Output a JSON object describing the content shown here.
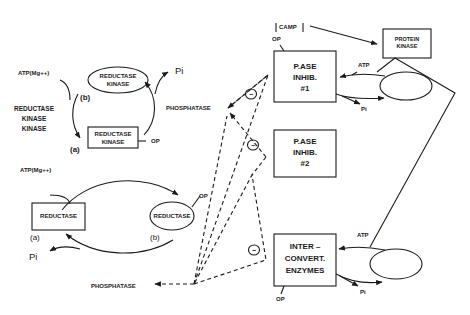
{
  "diagram": {
    "left_cycle_top": {
      "atp_label": "ATP(Mg++)",
      "kinase_kinase_label": [
        "REDUCTASE",
        "KINASE",
        "KINASE"
      ],
      "state_b_label": "(b)",
      "state_a_label": "(a)",
      "ellipse_label": [
        "REDUCTASE",
        "KINASE"
      ],
      "box_label": [
        "REDUCTASE",
        "KINASE"
      ],
      "op_label": "OP",
      "pi_label": "Pi",
      "phosphatase_label": "PHOSPHATASE"
    },
    "left_cycle_bottom": {
      "atp_label": "ATP(Mg++)",
      "box_label": "REDUCTASE",
      "box_state": "(a)",
      "ellipse_label": "REDUCTASE",
      "ellipse_state": "(b)",
      "op_label": "OP",
      "pi_label": "Pi",
      "phosphatase_label": "PHOSPHATASE"
    },
    "inhibition_marks": [
      "−",
      "−",
      "−"
    ],
    "camp_label": "CAMP",
    "protein_kinase_label": [
      "PROTEIN",
      "KINASE"
    ],
    "pase_inhib_1": {
      "label": [
        "P.ASE",
        "INHIB.",
        "#1"
      ],
      "op_label": "OP",
      "atp_label": "ATP",
      "pi_label": "Pi"
    },
    "pase_inhib_2": {
      "label": [
        "P.ASE",
        "INHIB.",
        "#2"
      ]
    },
    "interconvert": {
      "label": [
        "INTER –",
        "CONVERT.",
        "ENZYMES"
      ],
      "op_label": "OP",
      "atp_label": "ATP",
      "pi_label": "Pi"
    }
  }
}
